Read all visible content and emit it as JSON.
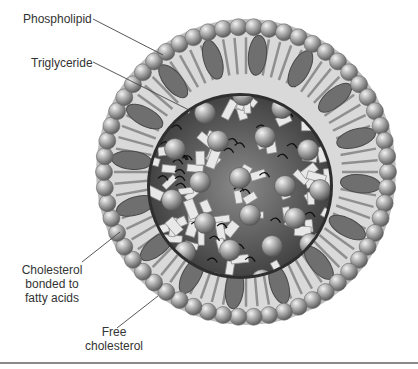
{
  "diagram": {
    "labels": {
      "phospholipid": "Phospholipid",
      "triglyceride": "Triglyceride",
      "cholesterol_ester_l1": "Cholesterol",
      "cholesterol_ester_l2": "bonded to",
      "cholesterol_ester_l3": "fatty acids",
      "free_cholesterol_l1": "Free",
      "free_cholesterol_l2": "cholesterol"
    },
    "colors": {
      "sphere": "#9a9a9a",
      "shell": "#cfcfcf",
      "shell_dark": "#6e6e6e",
      "core_bg": "#3a3a3a",
      "block": "#e6e6e6",
      "leader": "#444444"
    }
  }
}
